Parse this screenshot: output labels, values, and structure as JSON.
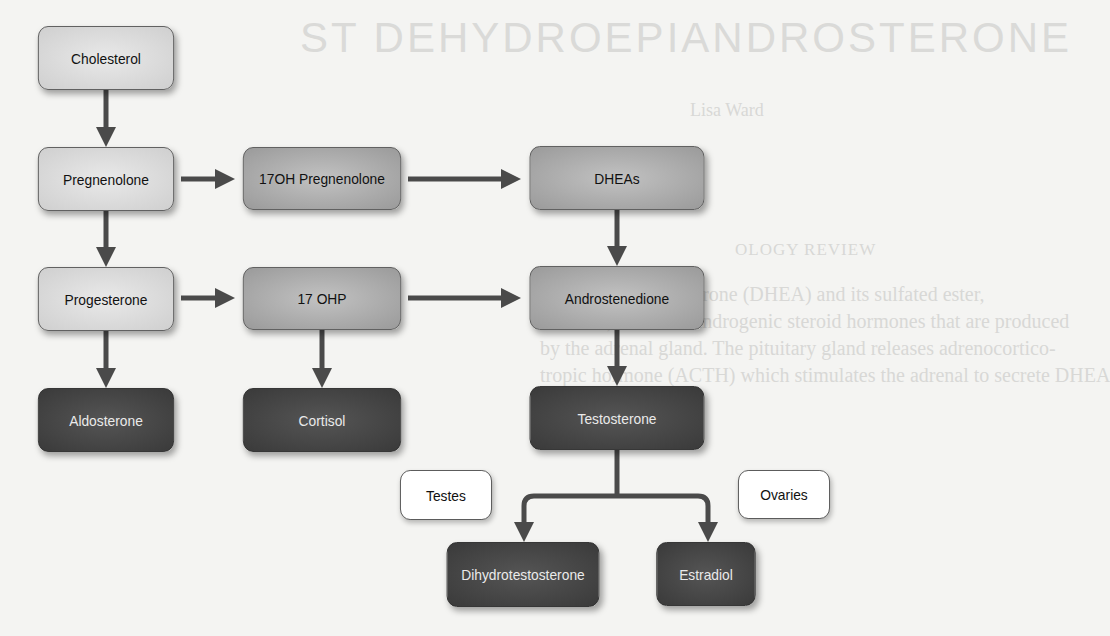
{
  "background_text": {
    "title": "ST DEHYDROEPIANDROSTERONE",
    "author": "Lisa Ward",
    "heading": "OLOGY REVIEW",
    "lines": [
      "Dehydroepiandrosterone (DHEA) and its sulfated ester,",
      "DHEAS, are weak androgenic steroid hormones that are produced",
      "by the adrenal gland. The pituitary gland releases adrenocortico-",
      "tropic hormone (ACTH) which stimulates the adrenal to secrete DHEA"
    ]
  },
  "diagram": {
    "colors": {
      "light": "#d9d9d9",
      "mid": "#a8a8a8",
      "dark": "#404040",
      "label_box": "#ffffff",
      "arrow": "#4a4a4a"
    },
    "nodes": {
      "cholesterol": "Cholesterol",
      "pregnenolone": "Pregnenolone",
      "oh17_pregnenolone": "17OH Pregnenolone",
      "dheas": "DHEAs",
      "progesterone": "Progesterone",
      "ohp17": "17 OHP",
      "androstenedione": "Androstenedione",
      "aldosterone": "Aldosterone",
      "cortisol": "Cortisol",
      "testosterone": "Testosterone",
      "testes": "Testes",
      "ovaries": "Ovaries",
      "dihydrotestosterone": "Dihydrotestosterone",
      "estradiol": "Estradiol"
    },
    "edges": [
      [
        "Cholesterol",
        "Pregnenolone"
      ],
      [
        "Pregnenolone",
        "17OH Pregnenolone"
      ],
      [
        "17OH Pregnenolone",
        "DHEAs"
      ],
      [
        "Pregnenolone",
        "Progesterone"
      ],
      [
        "DHEAs",
        "Androstenedione"
      ],
      [
        "Progesterone",
        "17 OHP"
      ],
      [
        "17 OHP",
        "Androstenedione"
      ],
      [
        "Progesterone",
        "Aldosterone"
      ],
      [
        "17 OHP",
        "Cortisol"
      ],
      [
        "Androstenedione",
        "Testosterone"
      ],
      [
        "Testosterone",
        "Dihydrotestosterone"
      ],
      [
        "Testosterone",
        "Estradiol"
      ]
    ]
  }
}
